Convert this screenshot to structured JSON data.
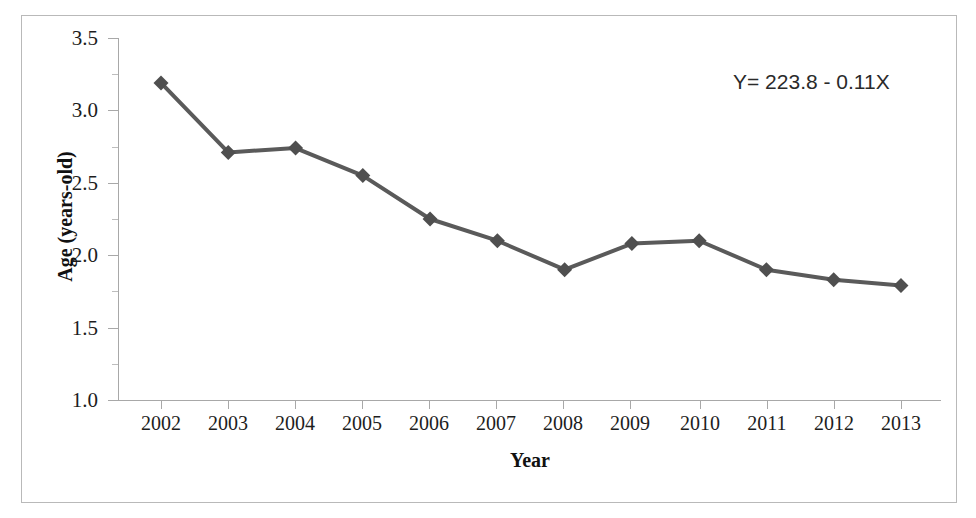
{
  "chart_data": {
    "type": "line",
    "title": "",
    "xlabel": "Year",
    "ylabel": "Age (years-old)",
    "categories": [
      "2002",
      "2003",
      "2004",
      "2005",
      "2006",
      "2007",
      "2008",
      "2009",
      "2010",
      "2011",
      "2012",
      "2013"
    ],
    "x": [
      2002,
      2003,
      2004,
      2005,
      2006,
      2007,
      2008,
      2009,
      2010,
      2011,
      2012,
      2013
    ],
    "values": [
      3.19,
      2.71,
      2.74,
      2.55,
      2.25,
      2.1,
      1.9,
      2.08,
      2.1,
      1.9,
      1.83,
      1.79
    ],
    "series": [
      {
        "name": "Age",
        "values": [
          3.19,
          2.71,
          2.74,
          2.55,
          2.25,
          2.1,
          1.9,
          2.08,
          2.1,
          1.9,
          1.83,
          1.79
        ],
        "color": "#5a5a5a",
        "marker": "diamond"
      }
    ],
    "ylim": [
      1.0,
      3.5
    ],
    "ytick_labels": [
      "3.5",
      "3.0",
      "2.5",
      "2.0",
      "1.5",
      "1.0"
    ],
    "yticks": [
      3.5,
      3.0,
      2.5,
      2.0,
      1.5,
      1.0
    ],
    "yminor_ticks": [
      3.25,
      2.75,
      2.25,
      1.75,
      1.25
    ],
    "xlim": [
      2001.5,
      2013.5
    ],
    "grid": false,
    "legend": false,
    "annotations": [
      {
        "name": "regression-equation",
        "text": "Y= 223.8 - 0.11X"
      }
    ],
    "colors": {
      "line": "#5a5a5a",
      "marker": "#4f4f4f",
      "axis": "#a8a8a8",
      "frame": "#b9b9b9",
      "text": "#1d1d1d",
      "background": "#ffffff"
    }
  }
}
